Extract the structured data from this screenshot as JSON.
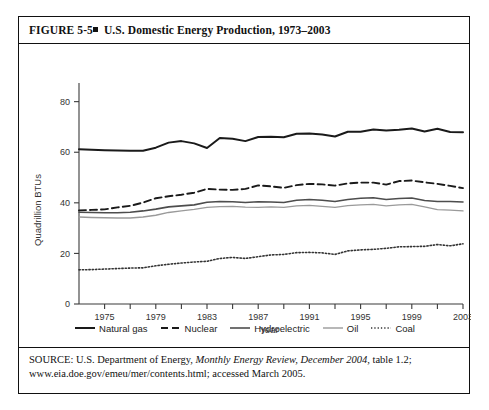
{
  "figure": {
    "number": "FIGURE  5-5",
    "bullet": "square-bullet",
    "title": "U.S. Domestic Energy Production, 1973–2003"
  },
  "source": {
    "prefix": "SOURCE: U.S. Department of Energy, ",
    "italic": "Monthly Energy Review, December 2004",
    "suffix": ", table 1.2; www.eia.doe.gov/emeu/mer/contents.html; accessed March 2005."
  },
  "legend": {
    "position": "below-axis",
    "items": [
      {
        "label": "Natural gas",
        "style": "solid-thick",
        "color": "#1a1a1a"
      },
      {
        "label": "Nuclear",
        "style": "dashed",
        "color": "#1a1a1a"
      },
      {
        "label": "Hydroelectric",
        "style": "solid-medium",
        "color": "#4d4d4d"
      },
      {
        "label": "Oil",
        "style": "solid-light",
        "color": "#9a9a9a"
      },
      {
        "label": "Coal",
        "style": "dotted",
        "color": "#333333"
      }
    ]
  },
  "chart_data": {
    "type": "line",
    "title": "U.S. Domestic Energy Production, 1973–2003",
    "xlabel": "Year",
    "ylabel": "Quadrillion BTUs",
    "xlim": [
      1973,
      2003
    ],
    "ylim": [
      0,
      85
    ],
    "grid": false,
    "y_ticks": [
      0,
      20,
      40,
      60,
      80
    ],
    "x_ticks": [
      1975,
      1977,
      1979,
      1981,
      1983,
      1985,
      1987,
      1989,
      1991,
      1993,
      1995,
      1997,
      1999,
      2001,
      2003
    ],
    "x_tick_labels": [
      "1975",
      "",
      "1979",
      "",
      "1983",
      "",
      "1987",
      "",
      "1991",
      "",
      "1995",
      "",
      "1999",
      "",
      "2003"
    ],
    "x": [
      1973,
      1974,
      1975,
      1976,
      1977,
      1978,
      1979,
      1980,
      1981,
      1982,
      1983,
      1984,
      1985,
      1986,
      1987,
      1988,
      1989,
      1990,
      1991,
      1992,
      1993,
      1994,
      1995,
      1996,
      1997,
      1998,
      1999,
      2000,
      2001,
      2002,
      2003
    ],
    "series": [
      {
        "name": "Natural gas",
        "style": "solid-thick",
        "color": "#1a1a1a",
        "values": [
          61.2,
          61.0,
          60.8,
          60.7,
          60.6,
          60.6,
          61.8,
          63.8,
          64.4,
          63.5,
          61.7,
          65.6,
          65.3,
          64.4,
          66.0,
          66.1,
          65.9,
          67.3,
          67.4,
          67.0,
          66.2,
          68.1,
          68.1,
          69.0,
          68.6,
          68.9,
          69.4,
          68.2,
          69.3,
          68.0,
          67.9
        ]
      },
      {
        "name": "Nuclear",
        "style": "dashed",
        "color": "#1a1a1a",
        "values": [
          37.0,
          37.2,
          37.4,
          38.2,
          38.8,
          40.1,
          41.8,
          42.6,
          43.2,
          44.0,
          45.5,
          45.2,
          45.1,
          45.5,
          46.9,
          46.5,
          45.9,
          47.0,
          47.5,
          47.3,
          46.8,
          47.7,
          48.0,
          48.0,
          47.2,
          48.6,
          48.8,
          48.1,
          47.5,
          46.7,
          45.8
        ]
      },
      {
        "name": "Hydroelectric",
        "style": "solid-medium",
        "color": "#4d4d4d",
        "values": [
          36.3,
          36.2,
          36.1,
          36.1,
          36.3,
          36.8,
          37.5,
          38.4,
          38.8,
          39.2,
          40.2,
          40.5,
          40.4,
          40.1,
          40.4,
          40.3,
          40.1,
          41.0,
          41.3,
          41.0,
          40.5,
          41.3,
          41.8,
          42.0,
          41.3,
          41.7,
          41.9,
          40.9,
          40.5,
          40.5,
          40.3
        ]
      },
      {
        "name": "Oil",
        "style": "solid-light",
        "color": "#9a9a9a",
        "values": [
          34.4,
          34.2,
          34.1,
          34.0,
          34.0,
          34.4,
          35.1,
          36.2,
          36.8,
          37.4,
          38.2,
          38.5,
          38.6,
          38.3,
          38.2,
          38.4,
          38.2,
          38.8,
          39.0,
          38.6,
          38.2,
          38.9,
          39.2,
          39.4,
          38.8,
          39.2,
          39.4,
          38.4,
          37.3,
          37.1,
          36.8
        ]
      },
      {
        "name": "Coal",
        "style": "dotted",
        "color": "#333333",
        "values": [
          13.5,
          13.6,
          13.8,
          14.0,
          14.2,
          14.3,
          15.1,
          15.7,
          16.2,
          16.6,
          16.9,
          18.0,
          18.4,
          18.0,
          18.7,
          19.4,
          19.6,
          20.3,
          20.4,
          20.2,
          19.6,
          21.0,
          21.4,
          21.6,
          22.0,
          22.6,
          22.7,
          22.8,
          23.5,
          23.0,
          23.8
        ]
      }
    ]
  }
}
